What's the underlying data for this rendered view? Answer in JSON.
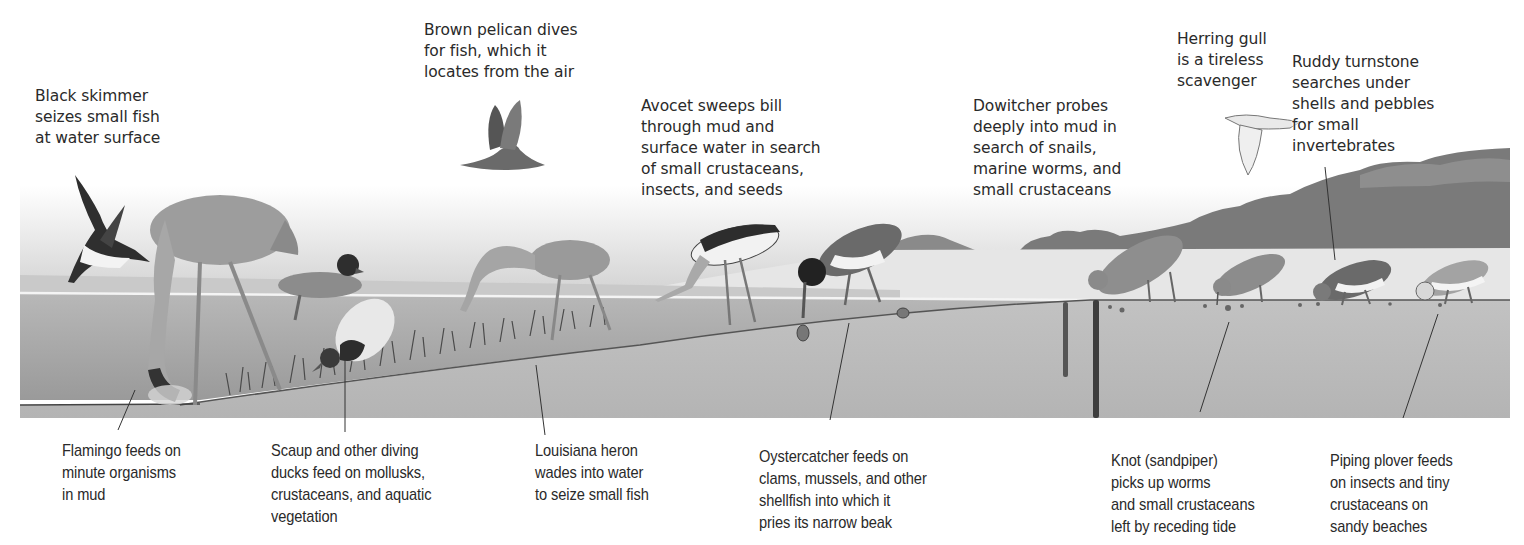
{
  "figure": {
    "colors": {
      "sky_top": "#ffffff",
      "sky_bottom": "#d9d9d9",
      "water": "#a9a9a9",
      "water_surface_line": "#f2f2f2",
      "mud": "#bdbdbd",
      "sand": "#e4e4e4",
      "hills": "#7d7d7d",
      "leader_line": "#333333",
      "text": "#2a2a2a"
    },
    "top_labels": [
      {
        "id": "black-skimmer",
        "text": "Black skimmer\nseizes small fish\nat water surface"
      },
      {
        "id": "brown-pelican",
        "text": "Brown pelican dives\nfor fish, which it\nlocates from the air"
      },
      {
        "id": "avocet",
        "text": "Avocet sweeps bill\nthrough mud and\nsurface water in search\nof small crustaceans,\ninsects, and seeds"
      },
      {
        "id": "dowitcher",
        "text": "Dowitcher probes\ndeeply into mud in\nsearch of snails,\nmarine worms, and\nsmall crustaceans"
      },
      {
        "id": "herring-gull",
        "text": "Herring gull\nis a tireless\nscavenger"
      },
      {
        "id": "ruddy-turnstone",
        "text": "Ruddy turnstone\nsearches under\nshells and pebbles\nfor small\ninvertebrates"
      }
    ],
    "bottom_labels": [
      {
        "id": "flamingo",
        "text": "Flamingo feeds on\nminute organisms\nin mud"
      },
      {
        "id": "scaup",
        "text": "Scaup and other diving\nducks feed on mollusks,\ncrustaceans, and aquatic\nvegetation"
      },
      {
        "id": "louisiana-heron",
        "text": "Louisiana heron\nwades into water\nto seize small fish"
      },
      {
        "id": "oystercatcher",
        "text": "Oystercatcher feeds on\nclams, mussels, and other\nshellfish into which it\npries its narrow beak"
      },
      {
        "id": "knot",
        "text": "Knot (sandpiper)\npicks up worms\nand small crustaceans\nleft by receding tide"
      },
      {
        "id": "piping-plover",
        "text": "Piping plover feeds\non insects and tiny\ncrustaceans on\nsandy beaches"
      }
    ],
    "birds": [
      "black-skimmer",
      "flamingo",
      "brown-pelican",
      "scaup-surface",
      "scaup-diving",
      "louisiana-heron",
      "avocet",
      "oystercatcher",
      "herring-gull",
      "dowitcher",
      "knot",
      "ruddy-turnstone",
      "piping-plover"
    ]
  }
}
